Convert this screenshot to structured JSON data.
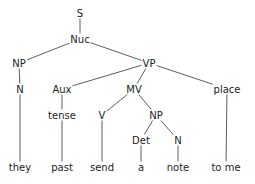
{
  "diagram": {
    "type": "syntax-tree",
    "nodes": [
      {
        "id": "S",
        "label": "S",
        "x": 80,
        "y": 13
      },
      {
        "id": "Nuc",
        "label": "Nuc",
        "x": 80,
        "y": 39
      },
      {
        "id": "NP1",
        "label": "NP",
        "x": 19,
        "y": 63
      },
      {
        "id": "VP",
        "label": "VP",
        "x": 149,
        "y": 63
      },
      {
        "id": "N1",
        "label": "N",
        "x": 20,
        "y": 89
      },
      {
        "id": "Aux",
        "label": "Aux",
        "x": 62,
        "y": 89
      },
      {
        "id": "MV",
        "label": "MV",
        "x": 134,
        "y": 89
      },
      {
        "id": "place",
        "label": "place",
        "x": 227,
        "y": 89
      },
      {
        "id": "tense",
        "label": "tense",
        "x": 62,
        "y": 115
      },
      {
        "id": "V",
        "label": "V",
        "x": 102,
        "y": 115
      },
      {
        "id": "NP2",
        "label": "NP",
        "x": 156,
        "y": 115
      },
      {
        "id": "Det",
        "label": "Det",
        "x": 141,
        "y": 140
      },
      {
        "id": "N2",
        "label": "N",
        "x": 178,
        "y": 140
      },
      {
        "id": "they",
        "label": "they",
        "x": 20,
        "y": 167
      },
      {
        "id": "past",
        "label": "past",
        "x": 62,
        "y": 167
      },
      {
        "id": "send",
        "label": "send",
        "x": 102,
        "y": 167
      },
      {
        "id": "a",
        "label": "a",
        "x": 141,
        "y": 167
      },
      {
        "id": "note",
        "label": "note",
        "x": 178,
        "y": 167
      },
      {
        "id": "tome",
        "label": "to  me",
        "x": 226,
        "y": 167
      }
    ],
    "edges": [
      [
        "S",
        "Nuc"
      ],
      [
        "Nuc",
        "NP1"
      ],
      [
        "Nuc",
        "VP"
      ],
      [
        "NP1",
        "N1"
      ],
      [
        "N1",
        "they"
      ],
      [
        "VP",
        "Aux"
      ],
      [
        "VP",
        "MV"
      ],
      [
        "VP",
        "place"
      ],
      [
        "Aux",
        "tense"
      ],
      [
        "tense",
        "past"
      ],
      [
        "MV",
        "V"
      ],
      [
        "MV",
        "NP2"
      ],
      [
        "V",
        "send"
      ],
      [
        "NP2",
        "Det"
      ],
      [
        "NP2",
        "N2"
      ],
      [
        "Det",
        "a"
      ],
      [
        "N2",
        "note"
      ],
      [
        "place",
        "tome"
      ]
    ]
  }
}
